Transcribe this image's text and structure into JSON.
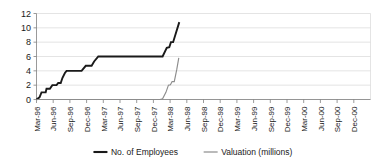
{
  "chart_data": {
    "type": "line",
    "title": "",
    "xlabel": "",
    "ylabel": "",
    "ylim": [
      0,
      12
    ],
    "ytick_values": [
      0,
      2,
      4,
      6,
      8,
      10,
      12
    ],
    "ytick_labels": [
      "0",
      "2",
      "4",
      "6",
      "8",
      "10",
      "12"
    ],
    "grid": true,
    "legend_position": "bottom",
    "categories": [
      "Mar-96",
      "Jun-96",
      "Sep-96",
      "Dec-96",
      "Mar-97",
      "Jun-97",
      "Sep-97",
      "Dec-97",
      "Mar-98",
      "Jun-98",
      "Sep-98",
      "Dec-98",
      "Mar-99",
      "Jun-99",
      "Sep-99",
      "Dec-99",
      "Mar-00",
      "Jun-00",
      "Sep-00",
      "Dec-00"
    ],
    "series": [
      {
        "name": "No. of Employees",
        "color": "#1a1a1a",
        "width": 1.9,
        "points": [
          {
            "x": 0.0,
            "y": 0.0
          },
          {
            "x": 0.18,
            "y": 0.3
          },
          {
            "x": 0.3,
            "y": 1.0
          },
          {
            "x": 0.55,
            "y": 1.0
          },
          {
            "x": 0.6,
            "y": 1.5
          },
          {
            "x": 0.8,
            "y": 1.5
          },
          {
            "x": 0.95,
            "y": 2.0
          },
          {
            "x": 1.2,
            "y": 2.0
          },
          {
            "x": 1.3,
            "y": 2.3
          },
          {
            "x": 1.45,
            "y": 2.3
          },
          {
            "x": 1.55,
            "y": 3.0
          },
          {
            "x": 1.7,
            "y": 3.7
          },
          {
            "x": 1.8,
            "y": 4.0
          },
          {
            "x": 2.7,
            "y": 4.0
          },
          {
            "x": 2.95,
            "y": 4.7
          },
          {
            "x": 3.3,
            "y": 4.7
          },
          {
            "x": 3.45,
            "y": 5.3
          },
          {
            "x": 3.7,
            "y": 6.0
          },
          {
            "x": 4.05,
            "y": 6.0
          },
          {
            "x": 7.55,
            "y": 6.0
          },
          {
            "x": 7.8,
            "y": 7.2
          },
          {
            "x": 7.95,
            "y": 7.3
          },
          {
            "x": 8.05,
            "y": 8.0
          },
          {
            "x": 8.18,
            "y": 8.0
          },
          {
            "x": 8.55,
            "y": 10.8
          }
        ]
      },
      {
        "name": "Valuation (millions)",
        "color": "#8c8c8c",
        "width": 1.15,
        "points": [
          {
            "x": 0.0,
            "y": 0.0
          },
          {
            "x": 7.4,
            "y": 0.0
          },
          {
            "x": 7.55,
            "y": 0.1
          },
          {
            "x": 7.75,
            "y": 1.0
          },
          {
            "x": 7.9,
            "y": 2.0
          },
          {
            "x": 8.02,
            "y": 2.05
          },
          {
            "x": 8.12,
            "y": 2.5
          },
          {
            "x": 8.25,
            "y": 2.5
          },
          {
            "x": 8.4,
            "y": 4.2
          },
          {
            "x": 8.52,
            "y": 5.8
          }
        ]
      }
    ]
  },
  "legend": {
    "items": [
      {
        "label": "No. of Employees",
        "color": "#1a1a1a"
      },
      {
        "label": "Valuation (millions)",
        "color": "#8c8c8c"
      }
    ]
  }
}
